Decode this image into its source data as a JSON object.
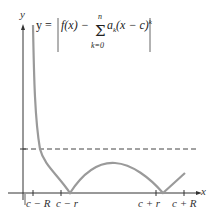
{
  "figure": {
    "formula": {
      "lhs": "y =",
      "f": "f(x) −",
      "sum_upper": "n",
      "sum_symbol": "Σ",
      "sum_lower": "k=0",
      "term": "a",
      "term_sub": "k",
      "term_rest": "(x − c)",
      "term_sup": "k"
    },
    "axes": {
      "x_label": "x",
      "y_label": "y"
    },
    "x_ticks": [
      "c − R",
      "c − r",
      "c + r",
      "c + R"
    ],
    "colors": {
      "curve": "#9a9a9a",
      "axis": "#333333",
      "dashed": "#444444"
    }
  }
}
